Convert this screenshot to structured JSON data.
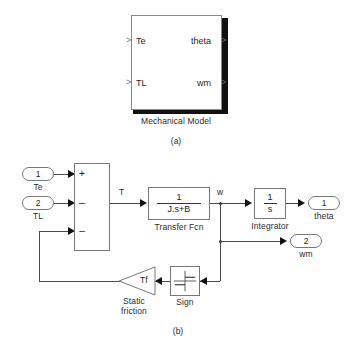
{
  "figure": {
    "background": "#ffffff",
    "line_color": "#4a4a4a",
    "block_border": "#777777",
    "text_color": "#1f1f1f"
  },
  "panel_a": {
    "caption": "(a)",
    "subsystem": {
      "name": "Mechanical Model",
      "inputs": [
        {
          "label": "Te"
        },
        {
          "label": "TL"
        }
      ],
      "outputs": [
        {
          "label": "theta"
        },
        {
          "label": "wm"
        }
      ]
    }
  },
  "panel_b": {
    "caption": "(b)",
    "inports": [
      {
        "number": "1",
        "label": "Te"
      },
      {
        "number": "2",
        "label": "TL"
      }
    ],
    "outports": [
      {
        "number": "1",
        "label": "theta"
      },
      {
        "number": "2",
        "label": "wm"
      }
    ],
    "sum_block": {
      "name": "Sum",
      "signs": [
        "+",
        "–",
        "–"
      ]
    },
    "transfer_fcn": {
      "name": "Transfer Fcn",
      "numerator": "1",
      "denominator": "J.s+B"
    },
    "integrator": {
      "name": "Integrator",
      "numerator": "1",
      "denominator": "s"
    },
    "sign_block": {
      "name": "Sign"
    },
    "gain_block": {
      "name_line1": "Static",
      "name_line2": "friction",
      "gain": "Tf"
    },
    "signal_labels": [
      {
        "id": "torque",
        "text": "T"
      },
      {
        "id": "speed",
        "text": "w"
      }
    ]
  }
}
